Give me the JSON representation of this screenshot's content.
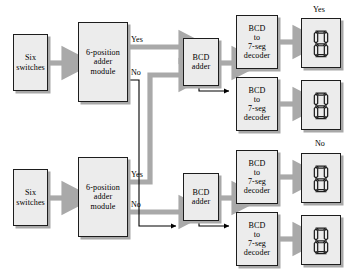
{
  "diagram": {
    "colors": {
      "box_fill": "#ececec",
      "box_border": "#1d1d1d",
      "box_shadow": "#a8a8a8",
      "thick_arrow": "#a9a9a9",
      "thin_arrow": "#000000",
      "background": "#ffffff",
      "segment_fill": "#ececec",
      "segment_stroke": "#1d1d1d"
    },
    "blocks": [
      {
        "id": "switches-top",
        "lines": [
          "Six",
          "switches"
        ]
      },
      {
        "id": "adder-module-top",
        "lines": [
          "6-position",
          "adder",
          "module"
        ]
      },
      {
        "id": "bcd-adder-top",
        "lines": [
          "BCD",
          "adder"
        ]
      },
      {
        "id": "decoder-1",
        "lines": [
          "BCD",
          "to",
          "7-seg",
          "decoder"
        ]
      },
      {
        "id": "decoder-2",
        "lines": [
          "BCD",
          "to",
          "7-seg",
          "decoder"
        ]
      },
      {
        "id": "switches-bottom",
        "lines": [
          "Six",
          "switches"
        ]
      },
      {
        "id": "adder-module-bottom",
        "lines": [
          "6-position",
          "adder",
          "module"
        ]
      },
      {
        "id": "bcd-adder-bottom",
        "lines": [
          "BCD",
          "adder"
        ]
      },
      {
        "id": "decoder-3",
        "lines": [
          "BCD",
          "to",
          "7-seg",
          "decoder"
        ]
      },
      {
        "id": "decoder-4",
        "lines": [
          "BCD",
          "to",
          "7-seg",
          "decoder"
        ]
      }
    ],
    "branch_labels": {
      "top_yes": "Yes",
      "top_no": "No",
      "bottom_yes": "Yes",
      "bottom_no": "No"
    },
    "display_labels": {
      "yes": "Yes",
      "no": "No"
    },
    "displays": [
      {
        "id": "display-yes-tens",
        "digit": "8",
        "segments": [
          "a",
          "b",
          "c",
          "d",
          "e",
          "f",
          "g"
        ]
      },
      {
        "id": "display-yes-ones",
        "digit": "8",
        "segments": [
          "a",
          "b",
          "c",
          "d",
          "e",
          "f",
          "g"
        ]
      },
      {
        "id": "display-no-tens",
        "digit": "8",
        "segments": [
          "a",
          "b",
          "c",
          "d",
          "e",
          "f",
          "g"
        ]
      },
      {
        "id": "display-no-ones",
        "digit": "8",
        "segments": [
          "a",
          "b",
          "c",
          "d",
          "e",
          "f",
          "g"
        ]
      }
    ]
  }
}
